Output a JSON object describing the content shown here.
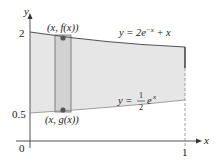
{
  "diagram": {
    "axes": {
      "x_label": "x",
      "y_label": "y",
      "origin_label": "0",
      "x_tick": "1",
      "y_ticks": [
        "2",
        "0.5"
      ]
    },
    "curves": {
      "upper": {
        "label_prefix": "y = 2e",
        "label_exp": "−x",
        "label_suffix": " + x"
      },
      "lower": {
        "label_prefix": "y = ",
        "label_num": "1",
        "label_den": "2",
        "label_base": "e",
        "label_exp": "x"
      }
    },
    "points": {
      "top": "(x, f(x))",
      "bottom": "(x, g(x))"
    },
    "colors": {
      "region": "#e6e6e6",
      "strip": "#d2d2d2",
      "curve": "#555555",
      "point": "#555555"
    }
  }
}
